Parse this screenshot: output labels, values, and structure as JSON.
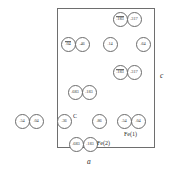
{
  "figure": {
    "type": "crystal-structure-projection",
    "unit_cell": {
      "x": 57,
      "y": 8,
      "width": 98,
      "height": 140,
      "border_color": "#6e6e6e"
    },
    "axes": [
      {
        "name": "c-axis-label",
        "text": "c",
        "x": 160,
        "y": 72
      },
      {
        "name": "a-axis-label",
        "text": "a",
        "x": 87,
        "y": 158
      }
    ],
    "site_labels": [
      {
        "name": "site-label-c",
        "text": "C",
        "x": 73,
        "y": 113
      },
      {
        "name": "site-label-fe1",
        "text": "Fe(1)",
        "x": 124,
        "y": 131
      },
      {
        "name": "site-label-fe2",
        "text": "Fe(2)",
        "x": 97,
        "y": 140
      }
    ],
    "atoms": [
      {
        "id": "atom-183-bar-top",
        "value": ".183",
        "overbar": true,
        "cx": 120,
        "cy": 19,
        "r": 7.5
      },
      {
        "id": "atom-317-top",
        "value": ".317",
        "overbar": false,
        "cx": 134,
        "cy": 19,
        "r": 7.5
      },
      {
        "id": "atom-04-bar-row2",
        "value": ".04",
        "overbar": true,
        "cx": 68,
        "cy": 44,
        "r": 7.5
      },
      {
        "id": "atom-46-row2",
        "value": ".46",
        "overbar": false,
        "cx": 82,
        "cy": 44,
        "r": 7.5
      },
      {
        "id": "atom-14-row2",
        "value": ".14",
        "overbar": false,
        "cx": 110,
        "cy": 44,
        "r": 7.5
      },
      {
        "id": "atom-64-row2",
        "value": ".64",
        "overbar": false,
        "cx": 143,
        "cy": 44,
        "r": 7.5
      },
      {
        "id": "atom-183-bar-row3",
        "value": ".183",
        "overbar": true,
        "cx": 120,
        "cy": 72,
        "r": 7.5
      },
      {
        "id": "atom-317-row3",
        "value": ".317",
        "overbar": false,
        "cx": 134,
        "cy": 72,
        "r": 7.5
      },
      {
        "id": "atom-683-row4",
        "value": ".683",
        "overbar": false,
        "cx": 75,
        "cy": 92,
        "r": 7.5
      },
      {
        "id": "atom-183-row4",
        "value": ".183",
        "overbar": false,
        "cx": 89,
        "cy": 92,
        "r": 7.5
      },
      {
        "id": "atom-54-left",
        "value": ".54",
        "overbar": false,
        "cx": 22,
        "cy": 121,
        "r": 7.5
      },
      {
        "id": "atom-04-left",
        "value": ".04",
        "overbar": false,
        "cx": 36,
        "cy": 121,
        "r": 7.5
      },
      {
        "id": "atom-36-c",
        "value": ".36",
        "overbar": false,
        "cx": 64,
        "cy": 121,
        "r": 7.5
      },
      {
        "id": "atom-86-mid",
        "value": ".86",
        "overbar": false,
        "cx": 99,
        "cy": 121,
        "r": 7.5
      },
      {
        "id": "atom-54-fe1",
        "value": ".54",
        "overbar": false,
        "cx": 124,
        "cy": 121,
        "r": 7.5
      },
      {
        "id": "atom-04-fe1",
        "value": ".04",
        "overbar": false,
        "cx": 138,
        "cy": 121,
        "r": 7.5
      },
      {
        "id": "atom-683-fe2",
        "value": ".683",
        "overbar": false,
        "cx": 76,
        "cy": 144,
        "r": 7.5
      },
      {
        "id": "atom-183-fe2",
        "value": ".183",
        "overbar": false,
        "cx": 90,
        "cy": 144,
        "r": 7.5
      }
    ]
  }
}
